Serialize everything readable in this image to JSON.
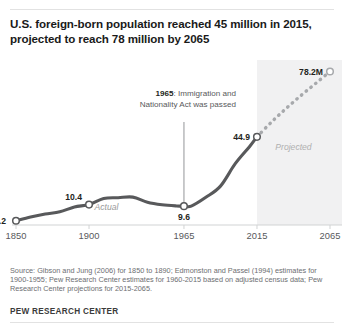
{
  "title": "U.S. foreign-born population reached 45 million in 2015, projected to reach 78 million by 2065",
  "source": "Source: Gibson and Jung (2006) for 1850 to 1890; Edmonston and Passel (1994) estimates for 1900-1955; Pew Research Center estimates for 1960-2015 based on adjusted census data; Pew Research Center projections for 2015-2065.",
  "brand": "PEW RESEARCH CENTER",
  "colors": {
    "actual_line": "#58595b",
    "projected_line": "#a7a9ac",
    "band_fill": "#f1f1f2",
    "axis": "#d1d3d4",
    "tick_text": "#58595b",
    "marker_fill": "#ffffff",
    "annotation_text": "#58595b"
  },
  "chart_data": {
    "type": "line",
    "title": "U.S. foreign-born population reached 45 million in 2015, projected to reach 78 million by 2065",
    "xlabel": "",
    "ylabel": "",
    "xlim": [
      1850,
      2065
    ],
    "ylim": [
      0,
      82
    ],
    "grid": false,
    "legend": false,
    "xticks": [
      "1850",
      "1900",
      "1965",
      "2015",
      "2065"
    ],
    "xtick_values": [
      1850,
      1900,
      1965,
      2015,
      2065
    ],
    "series": [
      {
        "name": "Actual",
        "style": "solid",
        "x": [
          1850,
          1860,
          1870,
          1880,
          1890,
          1900,
          1910,
          1920,
          1930,
          1940,
          1950,
          1960,
          1965,
          1970,
          1980,
          1990,
          2000,
          2010,
          2015
        ],
        "values": [
          2.2,
          4.1,
          5.6,
          6.7,
          9.2,
          10.4,
          13.5,
          13.9,
          14.2,
          11.6,
          10.3,
          9.7,
          9.6,
          9.6,
          14.1,
          19.8,
          31.1,
          40.0,
          44.9
        ]
      },
      {
        "name": "Projected",
        "style": "dotted",
        "x": [
          2015,
          2025,
          2035,
          2045,
          2055,
          2065
        ],
        "values": [
          44.9,
          52.5,
          59.4,
          65.9,
          72.0,
          78.2
        ]
      }
    ],
    "point_labels": [
      {
        "text": "2.2",
        "x": 1850,
        "value": 2.2
      },
      {
        "text": "10.4",
        "x": 1900,
        "value": 10.4
      },
      {
        "text": "9.6",
        "x": 1965,
        "value": 9.6
      },
      {
        "text": "44.9",
        "x": 2015,
        "value": 44.9
      },
      {
        "text": "78.2M",
        "x": 2065,
        "value": 78.2
      }
    ],
    "band_labels": {
      "actual": "Actual",
      "projected": "Projected"
    },
    "projection_band": {
      "from": 2015,
      "to": 2065
    },
    "annotation": {
      "bold": "1965",
      "line1_rest": ": Immigration and",
      "line2": "Nationality Act was passed",
      "points_to_x": 1965,
      "points_to_value": 9.6
    }
  }
}
